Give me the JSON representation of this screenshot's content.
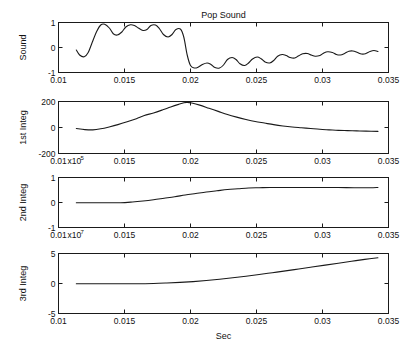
{
  "figure": {
    "title": "Pop Sound",
    "xlabel": "Sec",
    "background": "#ffffff",
    "line_color": "#1a1a1a"
  },
  "chart_data": [
    {
      "type": "line",
      "title": "Pop Sound",
      "ylabel": "Sound",
      "xlabel": "",
      "xlim": [
        0.01,
        0.035
      ],
      "ylim": [
        -1,
        1
      ],
      "grid": false,
      "legend": "none",
      "xticks": [
        0.01,
        0.015,
        0.02,
        0.025,
        0.03,
        0.035
      ],
      "xticklabels": [
        "0.01",
        "0.015",
        "0.02",
        "0.025",
        "0.03",
        "0.035"
      ],
      "yticks": [
        -1,
        0,
        1
      ],
      "yticklabels": [
        "-1",
        "0",
        "1"
      ],
      "x": [
        0.01135,
        0.0116,
        0.01195,
        0.01225,
        0.01255,
        0.0129,
        0.0132,
        0.0135,
        0.01385,
        0.01415,
        0.01445,
        0.0148,
        0.0151,
        0.01545,
        0.01575,
        0.01605,
        0.0164,
        0.0167,
        0.017,
        0.01735,
        0.01765,
        0.01795,
        0.0183,
        0.0186,
        0.0189,
        0.01925,
        0.0195,
        0.01975,
        0.02,
        0.0203,
        0.0206,
        0.0209,
        0.02125,
        0.02155,
        0.02185,
        0.0222,
        0.0225,
        0.0228,
        0.02315,
        0.02345,
        0.02375,
        0.0241,
        0.0244,
        0.0247,
        0.02505,
        0.02535,
        0.02565,
        0.026,
        0.0263,
        0.0266,
        0.02695,
        0.02725,
        0.02755,
        0.0279,
        0.0282,
        0.0285,
        0.02885,
        0.02915,
        0.02945,
        0.0298,
        0.0301,
        0.0304,
        0.03075,
        0.03105,
        0.03135,
        0.0317,
        0.032,
        0.0323,
        0.03265,
        0.03295,
        0.03325,
        0.0336,
        0.0339,
        0.0342
      ],
      "y": [
        -0.1,
        -0.3,
        -0.37,
        -0.2,
        0.2,
        0.65,
        0.9,
        0.93,
        0.78,
        0.55,
        0.5,
        0.62,
        0.82,
        0.91,
        0.88,
        0.78,
        0.68,
        0.72,
        0.88,
        0.9,
        0.75,
        0.52,
        0.42,
        0.52,
        0.72,
        0.73,
        0.4,
        -0.3,
        -0.72,
        -0.82,
        -0.78,
        -0.68,
        -0.62,
        -0.68,
        -0.8,
        -0.82,
        -0.7,
        -0.48,
        -0.4,
        -0.48,
        -0.65,
        -0.72,
        -0.62,
        -0.46,
        -0.38,
        -0.45,
        -0.58,
        -0.62,
        -0.52,
        -0.35,
        -0.28,
        -0.32,
        -0.4,
        -0.42,
        -0.33,
        -0.25,
        -0.24,
        -0.3,
        -0.35,
        -0.32,
        -0.22,
        -0.17,
        -0.2,
        -0.28,
        -0.3,
        -0.23,
        -0.15,
        -0.14,
        -0.2,
        -0.26,
        -0.25,
        -0.16,
        -0.12,
        -0.16
      ]
    },
    {
      "type": "line",
      "title": "",
      "ylabel": "1st Integ",
      "xlabel": "",
      "xlim": [
        0.01,
        0.035
      ],
      "ylim": [
        -200,
        200
      ],
      "grid": false,
      "legend": "none",
      "xticks": [
        0.01,
        0.015,
        0.02,
        0.025,
        0.03,
        0.035
      ],
      "xticklabels": [
        "0.01",
        "0.015",
        "0.02",
        "0.025",
        "0.03",
        "0.035"
      ],
      "x_exponent": "x10",
      "x_exponent_power": "5",
      "yticks": [
        -200,
        0,
        200
      ],
      "yticklabels": [
        "-200",
        "0",
        "200"
      ],
      "x": [
        0.01135,
        0.012,
        0.0126,
        0.0132,
        0.0139,
        0.0145,
        0.0152,
        0.0159,
        0.0165,
        0.0172,
        0.0179,
        0.0185,
        0.0191,
        0.0195,
        0.01975,
        0.0201,
        0.0207,
        0.0214,
        0.0221,
        0.0228,
        0.0235,
        0.0242,
        0.0249,
        0.0256,
        0.0263,
        0.027,
        0.0277,
        0.0284,
        0.0291,
        0.0298,
        0.0305,
        0.0312,
        0.0319,
        0.0326,
        0.0333,
        0.0342
      ],
      "y": [
        -8,
        -16,
        -18,
        -10,
        6,
        22,
        44,
        68,
        92,
        112,
        136,
        158,
        178,
        190,
        193,
        188,
        172,
        148,
        124,
        100,
        80,
        62,
        46,
        34,
        22,
        12,
        4,
        -2,
        -8,
        -14,
        -18,
        -22,
        -24,
        -26,
        -28,
        -30
      ]
    },
    {
      "type": "line",
      "title": "",
      "ylabel": "2nd Integ",
      "xlabel": "",
      "xlim": [
        0.01,
        0.035
      ],
      "ylim": [
        -1,
        1
      ],
      "grid": false,
      "legend": "none",
      "xticks": [
        0.01,
        0.015,
        0.02,
        0.025,
        0.03,
        0.035
      ],
      "xticklabels": [
        "0.01",
        "0.015",
        "0.02",
        "0.025",
        "0.03",
        "0.035"
      ],
      "x_exponent": "x10",
      "x_exponent_power": "7",
      "yticks": [
        -1,
        0,
        1
      ],
      "yticklabels": [
        "-1",
        "0",
        "1"
      ],
      "x": [
        0.01135,
        0.0125,
        0.0136,
        0.0147,
        0.0156,
        0.0164,
        0.0172,
        0.018,
        0.0188,
        0.0196,
        0.0204,
        0.0212,
        0.022,
        0.0228,
        0.0236,
        0.0244,
        0.0252,
        0.026,
        0.027,
        0.028,
        0.029,
        0.03,
        0.0312,
        0.0324,
        0.0336,
        0.0342
      ],
      "y": [
        -0.01,
        -0.01,
        -0.01,
        -0.01,
        0.02,
        0.06,
        0.11,
        0.17,
        0.23,
        0.3,
        0.36,
        0.42,
        0.47,
        0.52,
        0.55,
        0.58,
        0.59,
        0.6,
        0.6,
        0.6,
        0.6,
        0.6,
        0.6,
        0.59,
        0.59,
        0.6
      ]
    },
    {
      "type": "line",
      "title": "",
      "ylabel": "3rd Integ",
      "xlabel": "Sec",
      "xlim": [
        0.01,
        0.035
      ],
      "ylim": [
        -5,
        5
      ],
      "grid": false,
      "legend": "none",
      "xticks": [
        0.01,
        0.015,
        0.02,
        0.025,
        0.03,
        0.035
      ],
      "xticklabels": [
        "0.01",
        "0.015",
        "0.02",
        "0.025",
        "0.03",
        "0.035"
      ],
      "yticks": [
        -5,
        0,
        5
      ],
      "yticklabels": [
        "-5",
        "0",
        "5"
      ],
      "x": [
        0.01135,
        0.013,
        0.0145,
        0.016,
        0.0172,
        0.0182,
        0.0192,
        0.0202,
        0.0212,
        0.0222,
        0.0232,
        0.0242,
        0.0252,
        0.0262,
        0.0272,
        0.0282,
        0.0292,
        0.0302,
        0.0312,
        0.0322,
        0.0332,
        0.0342
      ],
      "y": [
        -0.05,
        -0.05,
        -0.05,
        -0.05,
        0.0,
        0.08,
        0.18,
        0.32,
        0.5,
        0.72,
        0.96,
        1.22,
        1.5,
        1.8,
        2.1,
        2.42,
        2.74,
        3.06,
        3.38,
        3.7,
        4.02,
        4.3
      ]
    }
  ]
}
